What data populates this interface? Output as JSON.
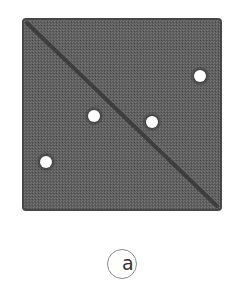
{
  "diagram": {
    "panel_label": "a",
    "square": {
      "x": 23,
      "y": 19,
      "width": 198,
      "height": 191,
      "fill": "#5f5f5f",
      "border": "#474747",
      "corner_radius": 3
    },
    "diagonal": {
      "x1": 27,
      "y1": 23,
      "x2": 217,
      "y2": 206,
      "color": "#3e3e3e",
      "width": 4
    },
    "points": [
      {
        "id": "p1",
        "cx": 200,
        "cy": 76,
        "r": 6,
        "side": "upper-right"
      },
      {
        "id": "p2",
        "cx": 94,
        "cy": 116,
        "r": 6,
        "side": "lower-left"
      },
      {
        "id": "p3",
        "cx": 152,
        "cy": 122,
        "r": 6,
        "side": "upper-right"
      },
      {
        "id": "p4",
        "cx": 46,
        "cy": 162,
        "r": 6,
        "side": "lower-left"
      }
    ],
    "point_fill": "#ffffff",
    "point_halo": "#3a3a3a"
  }
}
